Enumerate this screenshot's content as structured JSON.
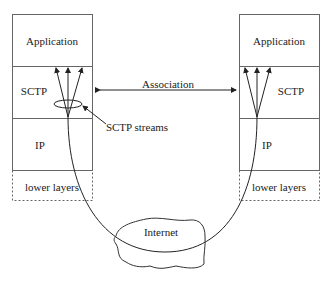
{
  "diagram": {
    "type": "network-protocol-stack",
    "left_host": {
      "layers": [
        {
          "label": "Application",
          "style": "solid"
        },
        {
          "label": "SCTP",
          "style": "solid"
        },
        {
          "label": "IP",
          "style": "solid"
        },
        {
          "label": "lower layers",
          "style": "dashed"
        }
      ]
    },
    "right_host": {
      "layers": [
        {
          "label": "Application",
          "style": "solid"
        },
        {
          "label": "SCTP",
          "style": "solid"
        },
        {
          "label": "IP",
          "style": "solid"
        },
        {
          "label": "lower layers",
          "style": "dashed"
        }
      ]
    },
    "association_label": "Association",
    "streams_label": "SCTP streams",
    "network_label": "Internet",
    "stream_count": 3,
    "colors": {
      "line": "#222222",
      "box": "#555555",
      "background": "#ffffff"
    }
  }
}
